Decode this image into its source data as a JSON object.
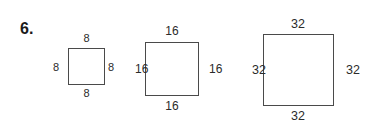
{
  "problem": {
    "number_label": "6."
  },
  "figures": [
    {
      "name": "square-small",
      "side_value": "8",
      "labels": {
        "top": "8",
        "right": "8",
        "bottom": "8",
        "left": "8"
      }
    },
    {
      "name": "square-medium",
      "side_value": "16",
      "labels": {
        "top": "16",
        "right": "16",
        "bottom": "16",
        "left": "16"
      }
    },
    {
      "name": "square-large",
      "side_value": "32",
      "labels": {
        "top": "32",
        "right": "32",
        "bottom": "32",
        "left": "32"
      }
    }
  ],
  "colors": {
    "stroke": "#4a4a4a",
    "text": "#2b2b2b",
    "number": "#1a1a1a",
    "background": "#ffffff"
  }
}
